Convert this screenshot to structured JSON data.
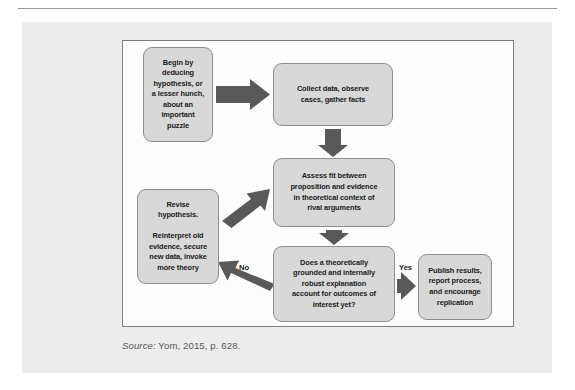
{
  "figure": {
    "nodes": {
      "hypothesis": "Begin by\ndeducing\nhypothesis, or\na lesser hunch,\nabout an\nimportant\npuzzle",
      "collect": "Collect data, observe\ncases, gather facts",
      "assess": "Assess fit between\nproposition and evidence\nin theoretical context of\nrival arguments",
      "revise": "Revise\nhypothesis.\n\nReinterpret old\nevidence, secure\nnew data, invoke\nmore theory",
      "decision": "Does a theoretically\ngrounded and internally\nrobust explanation\naccount for outcomes of\ninterest yet?",
      "publish": "Publish results,\nreport process,\nand encourage\nreplication"
    },
    "labels": {
      "no": "No",
      "yes": "Yes"
    },
    "source": {
      "label": "Source:",
      "text": " Yom, 2015, p. 628."
    },
    "colors": {
      "node_fill": "#d8d8d8",
      "node_border": "#8d8d8d",
      "arrow": "#595959",
      "panel_bg": "#ececed",
      "canvas_bg": "#fdfdfd",
      "canvas_border": "#7e7e7e",
      "text": "#1b1b1b",
      "caption_text": "#58595b",
      "rule": "#9a9a9a"
    }
  }
}
